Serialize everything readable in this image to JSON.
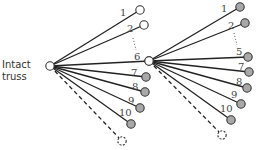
{
  "labels": {
    "root_line1": "Intact",
    "root_line2": "truss"
  },
  "colors": {
    "line": "#222222",
    "open_node_fill": "#ffffff",
    "failed_node_fill": "#a8a8a8",
    "node_stroke": "#333333"
  },
  "trees": [
    {
      "root": {
        "x": 50,
        "y": 66,
        "state": "open"
      },
      "branches": [
        {
          "label": "1",
          "x": 140,
          "y": 10,
          "state": "open",
          "style": "solid",
          "lx": 120,
          "ly": 16
        },
        {
          "label": "2",
          "x": 144,
          "y": 25,
          "state": "open",
          "style": "solid",
          "lx": 127,
          "ly": 32
        },
        {
          "label": "6",
          "x": 149,
          "y": 61,
          "state": "open",
          "style": "solid",
          "lx": 134,
          "ly": 60
        },
        {
          "label": "7",
          "x": 146,
          "y": 77,
          "state": "failed",
          "style": "solid",
          "lx": 131,
          "ly": 76
        },
        {
          "label": "8",
          "x": 145,
          "y": 92,
          "state": "failed",
          "style": "solid",
          "lx": 132,
          "ly": 90
        },
        {
          "label": "9",
          "x": 140,
          "y": 108,
          "state": "failed",
          "style": "solid",
          "lx": 128,
          "ly": 104
        },
        {
          "label": "10",
          "x": 131,
          "y": 124,
          "state": "failed",
          "style": "solid",
          "lx": 119,
          "ly": 116
        },
        {
          "label": "",
          "x": 122,
          "y": 141,
          "state": "unknown",
          "style": "dashed",
          "lx": 0,
          "ly": 0
        }
      ],
      "ellipsis": {
        "x1": 133,
        "y1": 38,
        "x2": 136,
        "y2": 50
      }
    },
    {
      "root": {
        "x": 149,
        "y": 61,
        "state": "open"
      },
      "branches": [
        {
          "label": "1",
          "x": 240,
          "y": 7,
          "state": "failed",
          "style": "solid",
          "lx": 221,
          "ly": 12
        },
        {
          "label": "2",
          "x": 245,
          "y": 23,
          "state": "failed",
          "style": "solid",
          "lx": 228,
          "ly": 29
        },
        {
          "label": "5",
          "x": 248,
          "y": 57,
          "state": "failed",
          "style": "solid",
          "lx": 236,
          "ly": 55
        },
        {
          "label": "7",
          "x": 249,
          "y": 72,
          "state": "failed",
          "style": "solid",
          "lx": 238,
          "ly": 70
        },
        {
          "label": "8",
          "x": 247,
          "y": 88,
          "state": "failed",
          "style": "solid",
          "lx": 236,
          "ly": 85
        },
        {
          "label": "9",
          "x": 241,
          "y": 104,
          "state": "failed",
          "style": "solid",
          "lx": 231,
          "ly": 98
        },
        {
          "label": "10",
          "x": 231,
          "y": 120,
          "state": "failed",
          "style": "solid",
          "lx": 220,
          "ly": 112
        },
        {
          "label": "",
          "x": 222,
          "y": 135,
          "state": "unknown",
          "style": "dashed",
          "lx": 0,
          "ly": 0
        }
      ],
      "ellipsis": {
        "x1": 234,
        "y1": 33,
        "x2": 237,
        "y2": 45
      }
    }
  ]
}
